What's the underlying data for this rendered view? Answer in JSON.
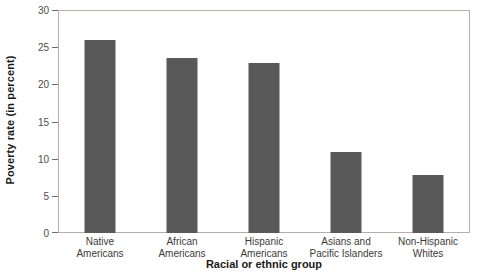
{
  "chart_data": {
    "type": "bar",
    "title": "",
    "xlabel": "Racial or ethnic group",
    "ylabel": "Poverty rate (in percent)",
    "categories": [
      "Native Americans",
      "African Americans",
      "Hispanic Americans",
      "Asians and Pacific Islanders",
      "Non-Hispanic Whites"
    ],
    "category_lines": [
      [
        "Native",
        "Americans"
      ],
      [
        "African",
        "Americans"
      ],
      [
        "Hispanic",
        "Americans"
      ],
      [
        "Asians and",
        "Pacific Islanders"
      ],
      [
        "Non-Hispanic",
        "Whites"
      ]
    ],
    "values": [
      26.1,
      23.7,
      23.0,
      11.0,
      7.9
    ],
    "ylim": [
      0,
      30
    ],
    "yticks": [
      0,
      5,
      10,
      15,
      20,
      25,
      30
    ],
    "ytick_labels": [
      "0",
      "5",
      "10",
      "15",
      "20",
      "25",
      "30"
    ],
    "grid": false,
    "legend": false,
    "bar_color": "#595959",
    "frame_color": "#b3b0ac",
    "axis_text_color": "#3d3a38"
  }
}
